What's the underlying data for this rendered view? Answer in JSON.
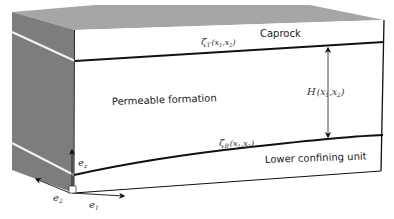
{
  "figure": {
    "layers": {
      "caprock": "Caprock",
      "permeable": "Permeable formation",
      "lower": "Lower confining unit"
    },
    "surfaces": {
      "top": {
        "symbol": "ζ",
        "sub": "T",
        "args": "(x",
        "a1": "1",
        "sep": ",x",
        "a2": "2",
        "close": ")"
      },
      "bottom": {
        "symbol": "ζ",
        "sub": "B",
        "args": "(x",
        "a1": "1",
        "sep": ",x",
        "a2": "2",
        "close": ")"
      }
    },
    "thickness": {
      "symbol": "H",
      "args": "(x",
      "a1": "1",
      "sep": ",x",
      "a2": "2",
      "close": ")"
    },
    "axes": {
      "e1": {
        "base": "e",
        "sub": "1"
      },
      "e2": {
        "base": "e",
        "sub": "2"
      },
      "ez": {
        "base": "e",
        "sub": "z"
      }
    },
    "colors": {
      "side_face": "#7d7d7d",
      "top_face": "#a6a6a6",
      "front_face": "#ffffff",
      "lines": "#111111"
    }
  }
}
